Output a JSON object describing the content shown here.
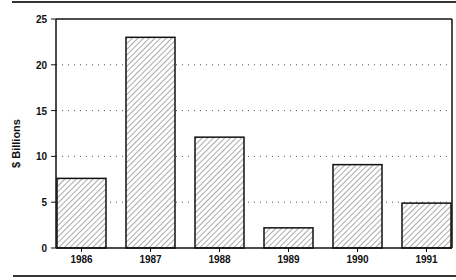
{
  "chart_data": {
    "type": "bar",
    "title": "",
    "xlabel": "",
    "ylabel": "$ Billions",
    "categories": [
      "1986",
      "1987",
      "1988",
      "1989",
      "1990",
      "1991"
    ],
    "values": [
      7.6,
      23.0,
      12.1,
      2.2,
      9.1,
      4.9
    ],
    "ylim": [
      0,
      25
    ],
    "yticks": [
      0,
      5,
      10,
      15,
      20,
      25
    ],
    "grid": {
      "y": true,
      "style": "dotted"
    },
    "legend": null,
    "bar_fill": "diagonal-hatch",
    "colors": {
      "bar_stroke": "#111111",
      "hatch": "#555555",
      "grid": "#555555",
      "rule": "#333333"
    }
  },
  "layout": {
    "width": 456,
    "height": 280,
    "plot": {
      "x0": 56,
      "x1": 452,
      "y_top": 19,
      "y_base": 248
    },
    "bar_x": [
      57,
      126,
      195,
      264,
      333,
      402
    ],
    "bar_width": 49,
    "top_rule": {
      "x0": 12,
      "x1": 456,
      "y": 2
    },
    "bottom_rule": {
      "x0": 13,
      "x1": 456,
      "y": 276
    }
  }
}
